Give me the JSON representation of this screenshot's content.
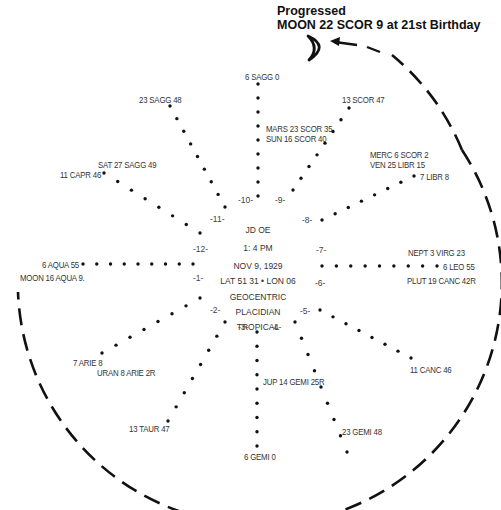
{
  "title": {
    "line1": "Progressed",
    "line2": "MOON 22 SCOR 9 at 21st Birthday",
    "symbol": "crescent-moon"
  },
  "chart_info": {
    "lines": [
      "JD OE",
      "1: 4 PM",
      "NOV 9, 1929",
      "LAT 51 31 • LON 06",
      "GEOCENTRIC",
      "PLACIDIAN",
      "TROPICAL"
    ]
  },
  "houses": [
    "-1-",
    "-2-",
    "-3-",
    "-4-",
    "-5-",
    "-6-",
    "-7-",
    "-8-",
    "-9-",
    "-10-",
    "-11-",
    "-12-"
  ],
  "cusps": [
    {
      "label": "6 SAGG 0",
      "house": 10
    },
    {
      "label": "13 SCOR 47",
      "house": 9
    },
    {
      "label": "7 LIBR 8",
      "house": 8
    },
    {
      "label": "6 LEO  55",
      "house": 7
    },
    {
      "label": "11 CANC 46",
      "house": 6
    },
    {
      "label": "23 GEMI 48",
      "house": 5
    },
    {
      "label": "6 GEMI 0",
      "house": 4
    },
    {
      "label": "13 TAUR 47",
      "house": 3
    },
    {
      "label": "7 ARIE 8",
      "house": 2
    },
    {
      "label": "6 AQUA 55",
      "house": 1
    },
    {
      "label": "11 CAPR 46",
      "house": 12
    },
    {
      "label": "23 SAGG 48",
      "house": 11
    }
  ],
  "planets": [
    {
      "label": "MARS 23 SCOR 35"
    },
    {
      "label": "SUN    16 SCOR 40"
    },
    {
      "label": "MERC   6 SCOR   2"
    },
    {
      "label": "VEN    25 LIBR  15"
    },
    {
      "label": "NEPT   3 VIRG 23"
    },
    {
      "label": "PLUT 19 CANC 42R"
    },
    {
      "label": "JUP 14 GEMI 25R"
    },
    {
      "label": "URAN 8 ARIE 2R"
    },
    {
      "label": "MOON 16 AQUA 9."
    },
    {
      "label": "SAT 27 SAGG 49"
    }
  ],
  "colors": {
    "ink": "#111111",
    "background": "#ffffff"
  }
}
